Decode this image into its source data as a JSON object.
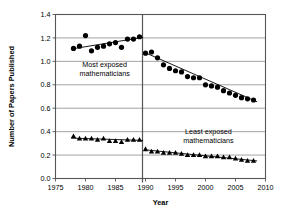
{
  "chart_data": {
    "type": "scatter",
    "title": "",
    "xlabel": "Year",
    "ylabel": "Number of Papers Published",
    "xlim": [
      1975,
      2010
    ],
    "ylim": [
      0.0,
      1.4
    ],
    "xticks": [
      1975,
      1980,
      1985,
      1990,
      1995,
      2000,
      2005,
      2010
    ],
    "xticklabels": [
      "1975",
      "1980",
      "1985",
      "1990",
      "1995",
      "2000",
      "2005",
      "2010"
    ],
    "yticks": [
      0.0,
      0.2,
      0.4,
      0.6,
      0.8,
      1.0,
      1.2,
      1.4
    ],
    "yticklabels": [
      "0.0",
      "0.2",
      "0.4",
      "0.6",
      "0.8",
      "1.0",
      "1.2",
      "1.4"
    ],
    "grid": "horizontal",
    "legend": "none",
    "divider_x": 1989.5,
    "annotations": [
      {
        "name": "most-exposed-label",
        "lines": [
          "Most exposed",
          "mathematicians"
        ],
        "x": 1983.2,
        "y": 0.95
      },
      {
        "name": "least-exposed-label",
        "lines": [
          "Least exposed",
          "mathematicians"
        ],
        "x": 2000.5,
        "y": 0.38
      }
    ],
    "series": [
      {
        "name": "Most exposed mathematicians",
        "marker": "circle",
        "color": "#000000",
        "segment": "pre-1990",
        "x": [
          1978,
          1979,
          1980,
          1981,
          1982,
          1983,
          1984,
          1985,
          1986,
          1987,
          1988,
          1989
        ],
        "values": [
          1.11,
          1.13,
          1.22,
          1.09,
          1.12,
          1.13,
          1.15,
          1.16,
          1.12,
          1.19,
          1.19,
          1.21
        ]
      },
      {
        "name": "Most exposed mathematicians",
        "marker": "circle",
        "color": "#000000",
        "segment": "post-1990",
        "x": [
          1990,
          1991,
          1992,
          1993,
          1994,
          1995,
          1996,
          1997,
          1998,
          1999,
          2000,
          2001,
          2002,
          2003,
          2004,
          2005,
          2006,
          2007,
          2008
        ],
        "values": [
          1.07,
          1.08,
          1.03,
          0.97,
          0.94,
          0.92,
          0.91,
          0.87,
          0.86,
          0.86,
          0.8,
          0.79,
          0.78,
          0.75,
          0.73,
          0.71,
          0.69,
          0.68,
          0.67
        ]
      },
      {
        "name": "Least exposed mathematicians",
        "marker": "triangle",
        "color": "#000000",
        "segment": "pre-1990",
        "x": [
          1978,
          1979,
          1980,
          1981,
          1982,
          1983,
          1984,
          1985,
          1986,
          1987,
          1988,
          1989
        ],
        "values": [
          0.36,
          0.34,
          0.34,
          0.34,
          0.33,
          0.34,
          0.32,
          0.32,
          0.31,
          0.33,
          0.33,
          0.33
        ]
      },
      {
        "name": "Least exposed mathematicians",
        "marker": "triangle",
        "color": "#000000",
        "segment": "post-1990",
        "x": [
          1990,
          1991,
          1992,
          1993,
          1994,
          1995,
          1996,
          1997,
          1998,
          1999,
          2000,
          2001,
          2002,
          2003,
          2004,
          2005,
          2006,
          2007,
          2008
        ],
        "values": [
          0.25,
          0.23,
          0.23,
          0.22,
          0.22,
          0.22,
          0.21,
          0.2,
          0.2,
          0.2,
          0.19,
          0.19,
          0.19,
          0.18,
          0.18,
          0.17,
          0.16,
          0.15,
          0.15
        ]
      }
    ],
    "trendlines": [
      {
        "name": "most-exposed-pre-1990-trend",
        "x": [
          1977.6,
          1989.6
        ],
        "y": [
          1.105,
          1.205
        ]
      },
      {
        "name": "most-exposed-post-1990-trend",
        "x": [
          1989.9,
          2008.6
        ],
        "y": [
          1.075,
          0.655
        ]
      },
      {
        "name": "least-exposed-pre-1990-trend",
        "x": [
          1977.6,
          1989.6
        ],
        "y": [
          0.345,
          0.325
        ]
      },
      {
        "name": "least-exposed-post-1990-trend",
        "x": [
          1989.9,
          2008.6
        ],
        "y": [
          0.245,
          0.15
        ]
      }
    ]
  }
}
